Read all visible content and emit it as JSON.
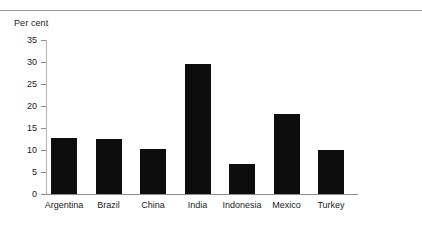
{
  "figure": {
    "unit_label": "Per cent",
    "has_top_rule": true,
    "background_color": "#ffffff",
    "bar_color": "#0d0d0d",
    "axis_color": "#8c8c8c"
  },
  "chart_data": {
    "type": "bar",
    "title": "",
    "subtitle": "",
    "xlabel": "",
    "ylabel": "Per cent",
    "categories": [
      "Argentina",
      "Brazil",
      "China",
      "India",
      "Indonesia",
      "Mexico",
      "Turkey"
    ],
    "values": [
      12.8,
      12.5,
      10.3,
      29.5,
      6.8,
      18.2,
      10.0
    ],
    "ylim": [
      0,
      35
    ],
    "ytick_values": [
      0,
      5,
      10,
      15,
      20,
      25,
      30,
      35
    ],
    "ytick_labels": [
      "0",
      "5",
      "10",
      "15",
      "20",
      "25",
      "30",
      "35"
    ],
    "grid": false,
    "legend": null,
    "legend_position": "none",
    "annotations": []
  }
}
